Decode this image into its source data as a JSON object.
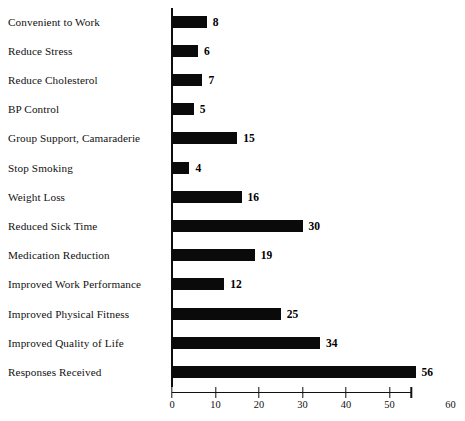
{
  "chart_data": {
    "type": "bar",
    "orientation": "horizontal",
    "title": "",
    "xlabel": "",
    "ylabel": "",
    "xlim": [
      0,
      60
    ],
    "grid": false,
    "legend": null,
    "categories": [
      "Convenient to Work",
      "Reduce Stress",
      "Reduce Cholesterol",
      "BP Control",
      "Group Support, Camaraderie",
      "Stop Smoking",
      "Weight Loss",
      "Reduced Sick Time",
      "Medication Reduction",
      "Improved Work Performance",
      "Improved Physical Fitness",
      "Improved Quality of Life",
      "Responses Received"
    ],
    "values": [
      8,
      6,
      7,
      5,
      15,
      4,
      16,
      30,
      19,
      12,
      25,
      34,
      56
    ],
    "value_labels": [
      "8",
      "6",
      "7",
      "5",
      "15",
      "4",
      "16",
      "30",
      "19",
      "12",
      "25",
      "34",
      "56"
    ],
    "x_ticks": [
      0,
      10,
      20,
      30,
      40,
      50,
      55
    ],
    "x_tick_labels": [
      "0",
      "10",
      "20",
      "30",
      "40",
      "50",
      "60"
    ],
    "x_tick_label_positions": [
      0,
      10,
      20,
      30,
      40,
      50,
      64
    ],
    "bar_color": "#0a0a0a",
    "axis_color": "#111111",
    "background_color": "#ffffff"
  }
}
